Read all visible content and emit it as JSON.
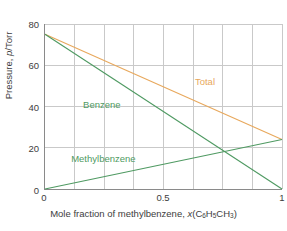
{
  "chart_data": {
    "type": "line",
    "title": "",
    "xlabel": "Mole fraction of methylbenzene, x(C6H5CH3)",
    "ylabel": "Pressure, p/Torr",
    "xlim": [
      0,
      1
    ],
    "ylim": [
      0,
      80
    ],
    "xticks": [
      0,
      0.5,
      1
    ],
    "xticklabels": [
      "0",
      "0.5",
      "1"
    ],
    "yticks": [
      0,
      20,
      40,
      60,
      80
    ],
    "yticklabels": [
      "0",
      "20",
      "40",
      "60",
      "80"
    ],
    "grid": true,
    "grid_x_step": 0.125,
    "grid_y_step": 20,
    "legend_position": "inline-annotations",
    "x": [
      0,
      1
    ],
    "series": [
      {
        "name": "Total",
        "label": "Total",
        "color": "#e8a85c",
        "values": [
          75,
          24
        ]
      },
      {
        "name": "Benzene",
        "label": "Benzene",
        "color": "#4f9a62",
        "values": [
          75,
          0
        ]
      },
      {
        "name": "Methylbenzene",
        "label": "Methylbenzene",
        "color": "#4f9a62",
        "values": [
          0,
          24
        ]
      }
    ],
    "annotations": [
      {
        "text": "Total",
        "x": 0.63,
        "y": 52
      },
      {
        "text": "Benzene",
        "x": 0.16,
        "y": 41
      },
      {
        "text": "Methylbenzene",
        "x": 0.11,
        "y": 15
      }
    ]
  },
  "axes": {
    "y_title": "Pressure, p/Torr",
    "y_title_prefix": "Pressure, ",
    "y_title_symbol": "p",
    "y_title_suffix": "/Torr",
    "x_title_prefix": "Mole fraction of methylbenzene, ",
    "x_title_symbol": "x",
    "x_title_formula_open": "(C",
    "x_title_sub1": "6",
    "x_title_h": "H",
    "x_title_sub2": "5",
    "x_title_ch": "CH",
    "x_title_sub3": "3",
    "x_title_close": ")",
    "ytick_0": "0",
    "ytick_20": "20",
    "ytick_40": "40",
    "ytick_60": "60",
    "ytick_80": "80",
    "xtick_0": "0",
    "xtick_05": "0.5",
    "xtick_1": "1"
  },
  "labels": {
    "total": "Total",
    "benzene": "Benzene",
    "methylbenzene": "Methylbenzene"
  },
  "colors": {
    "total_line": "#e8a85c",
    "benzene_line": "#4f9a62",
    "methylbenzene_line": "#4f9a62",
    "grid": "#c9c9c9",
    "axis": "#8a8a8a",
    "text": "#3d3d3d",
    "background": "#ffffff"
  }
}
